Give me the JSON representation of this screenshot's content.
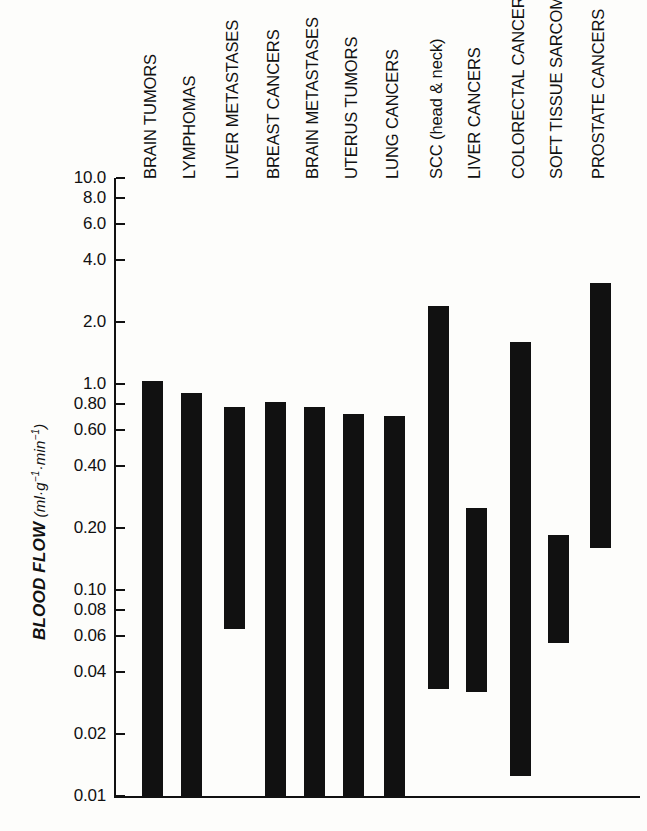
{
  "chart_data": {
    "type": "bar",
    "title": "",
    "subtitle": "",
    "xlabel": "",
    "ylabel": "BLOOD FLOW (ml·g⁻¹·min⁻¹)",
    "ylabel_main": "BLOOD FLOW",
    "ylabel_unit_open": "(",
    "ylabel_unit_ml": "ml",
    "ylabel_unit_dot1": "·",
    "ylabel_unit_g": "g",
    "ylabel_unit_exp1": "−1",
    "ylabel_unit_dot2": "·",
    "ylabel_unit_min": "min",
    "ylabel_unit_exp2": "−1",
    "ylabel_unit_close": ")",
    "scale": "log",
    "ylim": [
      0.01,
      10.0
    ],
    "grid": false,
    "legend": null,
    "bar_style": "floating-range",
    "yticks": [
      10.0,
      8.0,
      6.0,
      4.0,
      2.0,
      1.0,
      0.8,
      0.6,
      0.4,
      0.2,
      0.1,
      0.08,
      0.06,
      0.04,
      0.02,
      0.01
    ],
    "ytick_labels": [
      "10.0",
      "8.0",
      "6.0",
      "4.0",
      "2.0",
      "1.0",
      "0.80",
      "0.60",
      "0.40",
      "0.20",
      "0.10",
      "0.08",
      "0.06",
      "0.04",
      "0.02",
      "0.01"
    ],
    "categories": [
      "BRAIN TUMORS",
      "LYMPHOMAS",
      "LIVER METASTASES",
      "BREAST CANCERS",
      "BRAIN METASTASES",
      "UTERUS TUMORS",
      "LUNG CANCERS",
      "SCC (head & neck)",
      "LIVER CANCERS",
      "COLORECTAL CANCERS",
      "SOFT TISSUE SARCOMAS",
      "PROSTATE CANCERS"
    ],
    "ranges": [
      {
        "label": "BRAIN TUMORS",
        "high": 1.03,
        "low": 0.01
      },
      {
        "label": "LYMPHOMAS",
        "high": 0.9,
        "low": 0.01
      },
      {
        "label": "LIVER METASTASES",
        "high": 0.77,
        "low": 0.065
      },
      {
        "label": "BREAST CANCERS",
        "high": 0.82,
        "low": 0.01
      },
      {
        "label": "BRAIN METASTASES",
        "high": 0.77,
        "low": 0.01
      },
      {
        "label": "UTERUS TUMORS",
        "high": 0.715,
        "low": 0.01
      },
      {
        "label": "LUNG CANCERS",
        "high": 0.7,
        "low": 0.01
      },
      {
        "label": "SCC (head & neck)",
        "high": 2.4,
        "low": 0.033
      },
      {
        "label": "LIVER CANCERS",
        "high": 0.25,
        "low": 0.032
      },
      {
        "label": "COLORECTAL CANCERS",
        "high": 1.6,
        "low": 0.0125
      },
      {
        "label": "SOFT TISSUE SARCOMAS",
        "high": 0.185,
        "low": 0.055
      },
      {
        "label": "PROSTATE CANCERS",
        "high": 3.1,
        "low": 0.16
      }
    ],
    "colors": {
      "bar": "#111111",
      "axis": "#111111",
      "background": "#fdfdfb"
    }
  },
  "geometry": {
    "axis_x": 114,
    "axis_top": 178,
    "axis_bottom": 796,
    "plot_right": 640,
    "bar_width": 21,
    "bar_lefts": [
      142,
      181,
      224,
      265,
      304,
      343,
      384,
      428,
      466,
      510,
      548,
      590
    ],
    "label_baselines": [
      160,
      160,
      160,
      160,
      160,
      160,
      160,
      160,
      160,
      160,
      160,
      160
    ],
    "tick_pixels": {
      "10.0": 182,
      "8.0": 201,
      "6.0": 222,
      "4.0": 263,
      "2.0": 324,
      "1.0": 385,
      "0.80": 405,
      "0.60": 426,
      "0.40": 466,
      "0.20": 527,
      "0.10": 588,
      "0.08": 608,
      "0.06": 629,
      "0.04": 669,
      "0.02": 730,
      "0.01": 791
    }
  }
}
